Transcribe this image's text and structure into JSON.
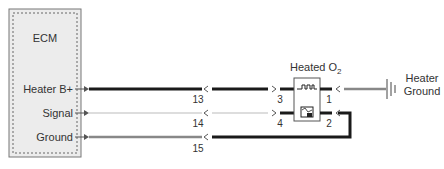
{
  "ecm": {
    "title": "ECM",
    "pins": [
      {
        "label": "Heater B+"
      },
      {
        "label": "Signal"
      },
      {
        "label": "Ground"
      }
    ]
  },
  "wires": [
    {
      "circuit": "13",
      "color": "#1a1a1a"
    },
    {
      "circuit": "14",
      "color": "#dddddd"
    },
    {
      "circuit": "15",
      "color": "#888888"
    }
  ],
  "sensor": {
    "title_main": "Heated O",
    "title_sub": "2",
    "pins": {
      "left_top": "3",
      "left_bottom": "4",
      "right_top": "1",
      "right_bottom": "2"
    }
  },
  "ground": {
    "label_line1": "Heater",
    "label_line2": "Ground"
  },
  "colors": {
    "ecm_fill": "#ececec",
    "ecm_border": "#777777",
    "heater_wire": "#1a1a1a",
    "signal_wire": "#dddddd",
    "ground_wire": "#888888"
  }
}
